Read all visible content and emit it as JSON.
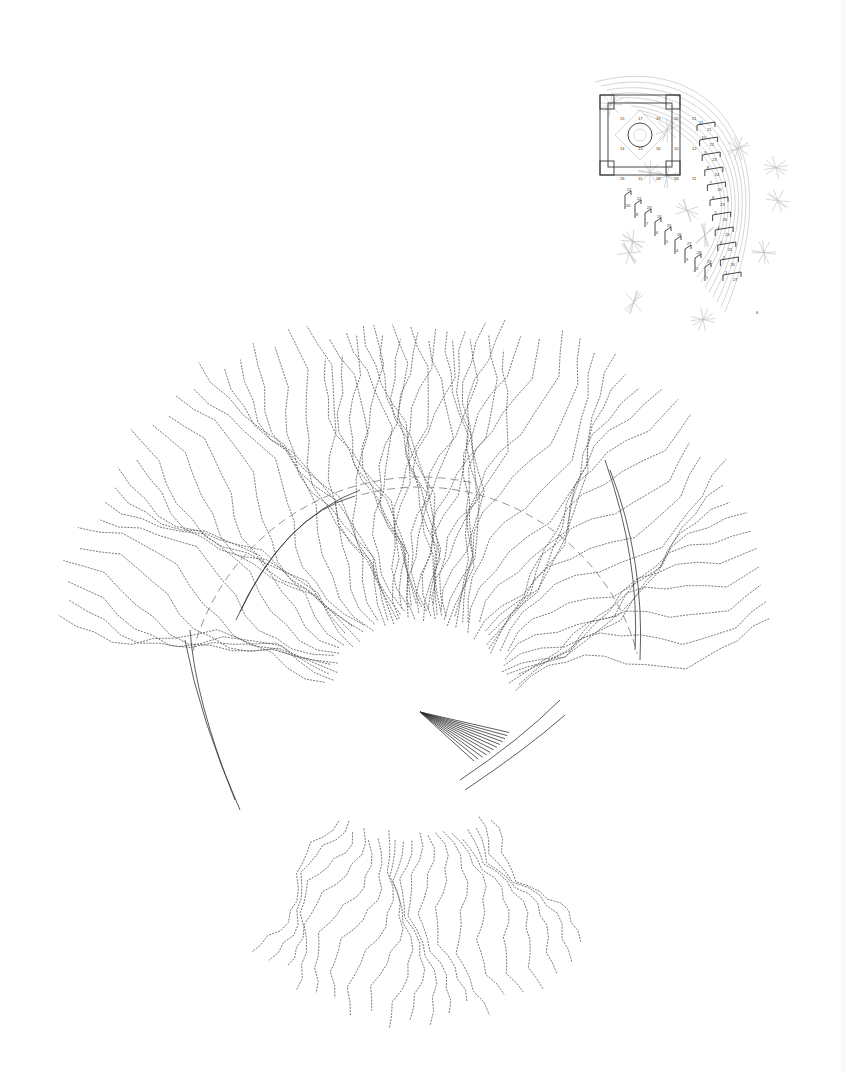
{
  "diagram": {
    "background": "#ffffff",
    "stroke_color": "#555555",
    "focus": {
      "x": 420,
      "y": 712
    },
    "left_fan": {
      "ray_count": 34,
      "angle_start_deg": 195,
      "angle_end_deg": 283,
      "inner_radius": 90,
      "outer_radius": 390,
      "dashed_arc_radius": 235
    },
    "right_fan": {
      "ray_count": 34,
      "angle_start_deg": 255,
      "angle_end_deg": 345,
      "inner_radius": 90,
      "outer_radius": 390,
      "dashed_arc_radius": 225
    },
    "bottom_fan": {
      "ray_count": 20,
      "angle_start_deg": 55,
      "angle_end_deg": 125,
      "inner_radius": 120,
      "outer_radius": 300
    }
  },
  "inset": {
    "x": 585,
    "y": 62,
    "width": 205,
    "height": 265,
    "frame_stroke": "#333333",
    "grid_labels": [
      "15",
      "17",
      "19",
      "20",
      "21",
      "14",
      "13",
      "16",
      "10",
      "12",
      "26",
      "11",
      "18",
      "13",
      "11"
    ],
    "stair_labels_right": [
      "11",
      "21",
      "10",
      "22",
      "9",
      "23",
      "8",
      "24",
      "7",
      "25",
      "6",
      "23",
      "5",
      "26",
      "4",
      "24",
      "3",
      "25",
      "2",
      "26",
      "1",
      "27"
    ],
    "stair_labels_left": [
      "21",
      "20",
      "22",
      "8",
      "23",
      "7",
      "24",
      "6",
      "25",
      "5",
      "26",
      "4",
      "27",
      "3",
      "28",
      "2",
      "29",
      "1"
    ],
    "corner_mark": "6"
  }
}
